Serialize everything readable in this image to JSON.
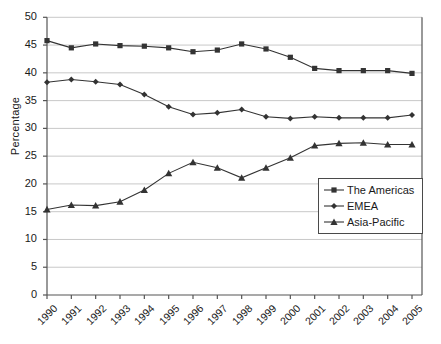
{
  "chart_data": {
    "type": "line",
    "title": "",
    "xlabel": "",
    "ylabel": "Percentage",
    "categories": [
      "1990",
      "1991",
      "1992",
      "1993",
      "1994",
      "1995",
      "1996",
      "1997",
      "1998",
      "1999",
      "2000",
      "2001",
      "2002",
      "2003",
      "2004",
      "2005"
    ],
    "ylim": [
      0,
      50
    ],
    "yticks": [
      0,
      5,
      10,
      15,
      20,
      25,
      30,
      35,
      40,
      45,
      50
    ],
    "grid": "horizontal",
    "legend_position": "lower-right-inside",
    "series": [
      {
        "name": "The Americas",
        "marker": "square",
        "color": "#333333",
        "values": [
          45.8,
          44.5,
          45.2,
          44.9,
          44.8,
          44.5,
          43.8,
          44.1,
          45.2,
          44.3,
          42.8,
          40.8,
          40.4,
          40.4,
          40.4,
          39.9
        ]
      },
      {
        "name": "EMEA",
        "marker": "diamond",
        "color": "#333333",
        "values": [
          38.3,
          38.8,
          38.4,
          37.9,
          36.1,
          33.9,
          32.5,
          32.8,
          33.4,
          32.1,
          31.8,
          32.1,
          31.9,
          31.9,
          31.9,
          32.4
        ]
      },
      {
        "name": "Asia-Pacific",
        "marker": "triangle",
        "color": "#333333",
        "values": [
          15.4,
          16.2,
          16.1,
          16.8,
          18.9,
          21.9,
          23.9,
          22.9,
          21.1,
          22.9,
          24.7,
          26.9,
          27.3,
          27.4,
          27.1,
          27.1
        ]
      }
    ]
  },
  "legend": {
    "entries": [
      {
        "label": "The Americas"
      },
      {
        "label": "EMEA"
      },
      {
        "label": "Asia-Pacific"
      }
    ]
  },
  "axis": {
    "y_title": "Percentage"
  },
  "colors": {
    "series": "#333333",
    "grid": "#c8c8c8",
    "axis": "#555555",
    "text": "#1a1a1a"
  }
}
